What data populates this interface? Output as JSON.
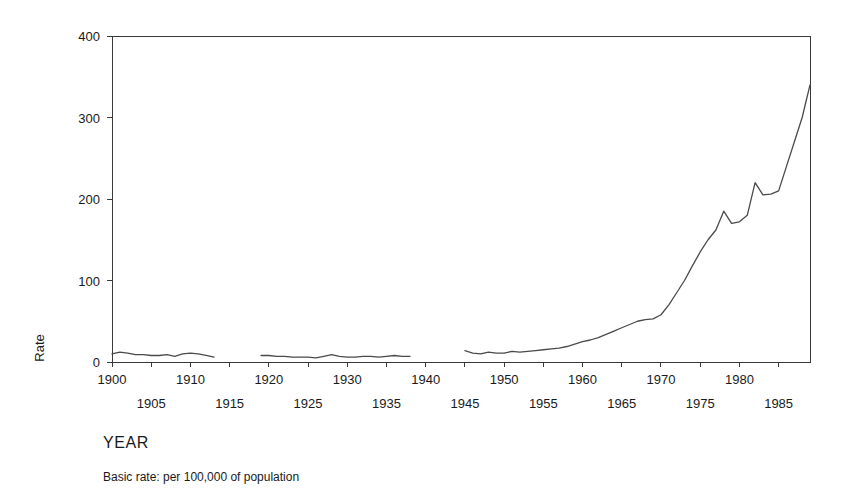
{
  "chart_data": {
    "type": "line",
    "title": "",
    "xlabel": "YEAR",
    "ylabel": "Rate",
    "caption": "Basic rate: per 100,000 of population",
    "xlim": [
      1900,
      1989
    ],
    "ylim": [
      0,
      400
    ],
    "grid": false,
    "legend": "none",
    "y_ticks": [
      0,
      100,
      200,
      300,
      400
    ],
    "y_tick_labels": [
      "0",
      "100",
      "200",
      "300",
      "400"
    ],
    "x_ticks": [
      1900,
      1905,
      1910,
      1915,
      1920,
      1925,
      1930,
      1935,
      1940,
      1945,
      1950,
      1955,
      1960,
      1965,
      1970,
      1975,
      1980,
      1985
    ],
    "x_tick_labels_upper": [
      "1900",
      "1910",
      "1920",
      "1930",
      "1940",
      "1950",
      "1960",
      "1970",
      "1980"
    ],
    "x_tick_labels_lower": [
      "1905",
      "1915",
      "1925",
      "1935",
      "1945",
      "1955",
      "1965",
      "1975",
      "1985"
    ],
    "line_color": "#4a4a4a",
    "background_color": "#ffffff",
    "axis_color": "#3a3a3a",
    "series": [
      {
        "name": "Rate",
        "note": "segment-1",
        "x": [
          1900,
          1901,
          1902,
          1903,
          1904,
          1905,
          1906,
          1907,
          1908,
          1909,
          1910,
          1911,
          1912,
          1913
        ],
        "values": [
          10,
          12,
          11,
          9,
          9,
          8,
          8,
          9,
          7,
          10,
          11,
          10,
          8,
          6
        ]
      },
      {
        "name": "Rate",
        "note": "segment-2",
        "x": [
          1919,
          1920,
          1921,
          1922,
          1923,
          1924,
          1925,
          1926,
          1927,
          1928,
          1929,
          1930,
          1931,
          1932,
          1933,
          1934,
          1935,
          1936,
          1937,
          1938
        ],
        "values": [
          8,
          8,
          7,
          7,
          6,
          6,
          6,
          5,
          7,
          9,
          7,
          6,
          6,
          7,
          7,
          6,
          7,
          8,
          7,
          7
        ]
      },
      {
        "name": "Rate",
        "note": "segment-3",
        "x": [
          1945,
          1946,
          1947,
          1948,
          1949,
          1950,
          1951,
          1952,
          1953,
          1954,
          1955,
          1956,
          1957,
          1958,
          1959,
          1960,
          1961,
          1962,
          1963,
          1964,
          1965,
          1966,
          1967,
          1968,
          1969,
          1970,
          1971,
          1972,
          1973,
          1974,
          1975,
          1976,
          1977,
          1978,
          1979,
          1980,
          1981,
          1982,
          1983,
          1984,
          1985,
          1986,
          1987,
          1988,
          1989
        ],
        "values": [
          14,
          11,
          10,
          12,
          11,
          11,
          13,
          12,
          13,
          14,
          15,
          16,
          17,
          19,
          22,
          25,
          27,
          30,
          34,
          38,
          42,
          46,
          50,
          52,
          53,
          58,
          70,
          85,
          100,
          118,
          135,
          150,
          162,
          185,
          170,
          172,
          180,
          220,
          205,
          206,
          210,
          240,
          270,
          300,
          340
        ]
      }
    ]
  }
}
